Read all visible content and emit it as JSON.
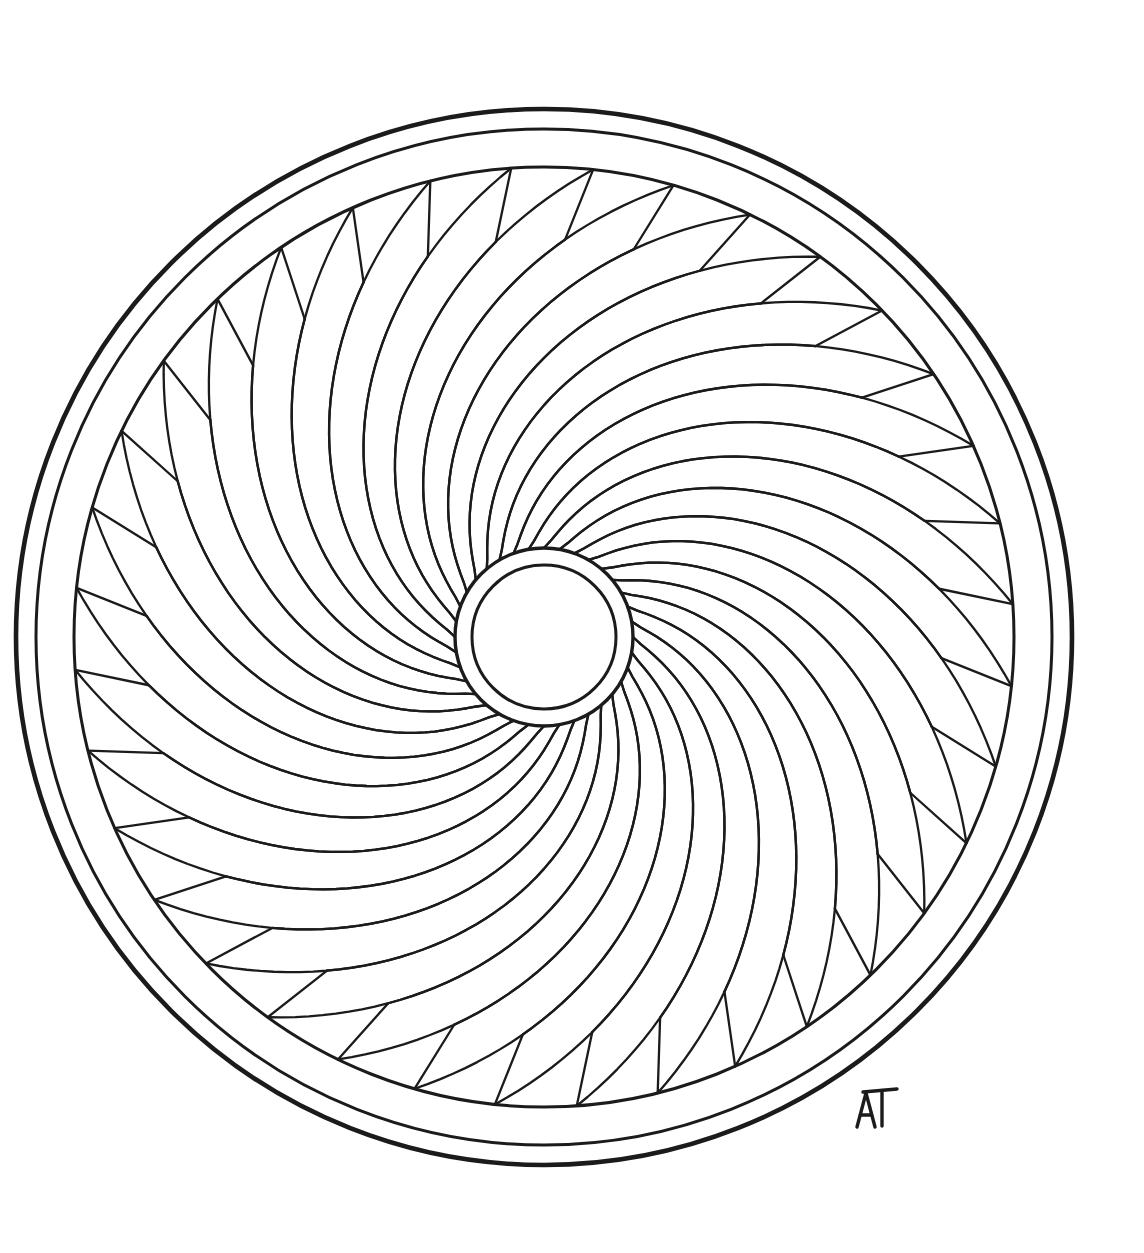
{
  "artwork": {
    "title": "Spiral Rosette Mandala",
    "medium": "ink line drawing",
    "background_color": "#ffffff",
    "ink_color": "#1b1b1b",
    "canvas": {
      "width": 1144,
      "height": 1253
    }
  },
  "geometry": {
    "center": {
      "x": 544,
      "y": 637
    },
    "rings": [
      {
        "name": "outer-border-ring",
        "radius": 528,
        "stroke_width": 4.6
      },
      {
        "name": "middle-border-ring",
        "radius": 508,
        "stroke_width": 3.0
      },
      {
        "name": "inner-border-ring",
        "radius": 470,
        "stroke_width": 3.0
      }
    ],
    "hub": [
      {
        "name": "hub-outer-circle",
        "radius": 89,
        "stroke_width": 3.4
      },
      {
        "name": "hub-inner-circle",
        "radius": 72,
        "stroke_width": 3.0
      }
    ],
    "petals": {
      "count": 36,
      "inner_radius": 89,
      "outer_radius": 470,
      "sweep_degrees": 86,
      "tooth_radius": 398,
      "spiral_samples": 48,
      "direction": "counter-clockwise-outward"
    }
  },
  "signature": {
    "text": "AT",
    "position": {
      "x": 857,
      "y": 1093
    },
    "style": "handwritten-monogram"
  },
  "labels": {
    "page_title": "Spiral Rosette Mandala",
    "artboard": "coloring-page-artboard",
    "motif": "36-petal spiral rosette with triple border ring and circular hub"
  }
}
